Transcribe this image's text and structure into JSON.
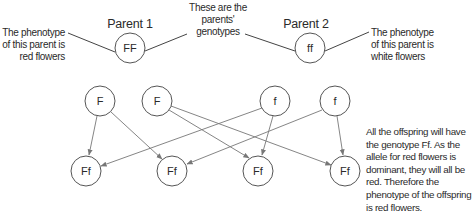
{
  "diagram": {
    "parents": [
      {
        "title": "Parent 1",
        "genotype": "FF",
        "phenotype_note": [
          "The phenotype",
          "of this parent is",
          "red flowers"
        ]
      },
      {
        "title": "Parent 2",
        "genotype": "ff",
        "phenotype_note": [
          "The phenotype",
          "of this parent is",
          "white flowers"
        ]
      }
    ],
    "genotype_callout": [
      "These are the",
      "parents'",
      "genotypes"
    ],
    "gametes": [
      {
        "allele": "F",
        "from": "Parent 1"
      },
      {
        "allele": "F",
        "from": "Parent 1"
      },
      {
        "allele": "f",
        "from": "Parent 2"
      },
      {
        "allele": "f",
        "from": "Parent 2"
      }
    ],
    "offspring": [
      {
        "genotype": "Ff"
      },
      {
        "genotype": "Ff"
      },
      {
        "genotype": "Ff"
      },
      {
        "genotype": "Ff"
      }
    ],
    "connections": [
      {
        "from_gamete": 0,
        "to_offspring": 0
      },
      {
        "from_gamete": 0,
        "to_offspring": 1
      },
      {
        "from_gamete": 1,
        "to_offspring": 2
      },
      {
        "from_gamete": 1,
        "to_offspring": 3
      },
      {
        "from_gamete": 2,
        "to_offspring": 0
      },
      {
        "from_gamete": 2,
        "to_offspring": 2
      },
      {
        "from_gamete": 3,
        "to_offspring": 1
      },
      {
        "from_gamete": 3,
        "to_offspring": 3
      }
    ],
    "conclusion": [
      "All the offspring will have",
      "the genotype Ff. As the",
      "allele for red flowers is",
      "dominant, they will all be",
      "red. Therefore the",
      "phenotype of the offspring",
      "is red flowers."
    ]
  },
  "colors": {
    "circle_stroke": "#555555",
    "arrow": "#777777",
    "text": "#2a2a2a",
    "background": "#ffffff"
  }
}
